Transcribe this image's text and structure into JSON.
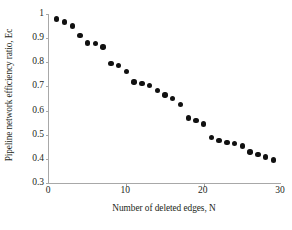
{
  "chart_data": {
    "type": "scatter",
    "title": "",
    "xlabel": "Number of deleted edges, N",
    "ylabel": "Pipeline network efficiency ratio, Ec",
    "xlim": [
      0,
      30
    ],
    "ylim": [
      0.3,
      1.0
    ],
    "xticks": [
      0,
      10,
      20,
      30
    ],
    "xtick_labels": [
      "0",
      "10",
      "20",
      "30"
    ],
    "yticks": [
      0.3,
      0.4,
      0.5,
      0.6,
      0.7,
      0.8,
      0.9,
      1.0
    ],
    "ytick_labels": [
      "0.3",
      "0.4",
      "0.5",
      "0.6",
      "0.7",
      "0.8",
      "0.9",
      "1"
    ],
    "grid": false,
    "legend": null,
    "marker": {
      "shape": "circle",
      "color": "#111111",
      "size_px": 5.4
    },
    "series": [
      {
        "name": "Pipeline network efficiency ratio",
        "x": [
          1,
          2,
          3,
          4,
          5,
          6,
          7,
          8,
          9,
          10,
          11,
          12,
          13,
          14,
          15,
          16,
          17,
          18,
          19,
          20,
          21,
          22,
          23,
          24,
          25,
          26,
          27,
          28,
          29
        ],
        "y": [
          0.98,
          0.967,
          0.951,
          0.911,
          0.88,
          0.879,
          0.863,
          0.795,
          0.787,
          0.763,
          0.719,
          0.712,
          0.703,
          0.684,
          0.665,
          0.649,
          0.626,
          0.569,
          0.559,
          0.544,
          0.489,
          0.476,
          0.467,
          0.464,
          0.454,
          0.429,
          0.419,
          0.407,
          0.395
        ]
      }
    ]
  }
}
